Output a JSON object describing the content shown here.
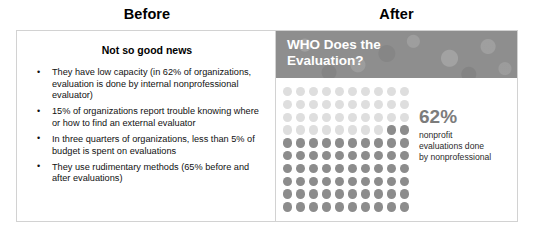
{
  "columns": {
    "before_title": "Before",
    "after_title": "After"
  },
  "before_panel": {
    "heading": "Not so good news",
    "bullets": [
      "They have low capacity (in 62% of organizations, evaluation is done by internal nonprofessional evaluator)",
      "15% of organizations report trouble knowing where or how to find an external evaluator",
      "In three quarters of organizations, less than 5% of budget is spent on evaluations",
      "They use rudimentary methods (65% before and after evaluations)"
    ]
  },
  "after_panel": {
    "banner_title": "WHO Does the\nEvaluation?",
    "callout_figure": "62%",
    "callout_caption": "nonprofit\nevaluations done\nby nonprofessional"
  },
  "colors": {
    "banner_background": "#8e8e8e",
    "banner_text": "#ffffff",
    "dot_filled": "#8c8c8c",
    "dot_empty": "#dedede",
    "callout_figure": "#7c7c7c",
    "panel_border": "#d2d2d2"
  },
  "chart_data": {
    "type": "waffle",
    "title": "WHO Does the Evaluation?",
    "rows": 10,
    "columns": 10,
    "total_cells": 100,
    "filled_cells": 62,
    "unit": "percent",
    "value": 62,
    "label": "nonprofit evaluations done by nonprofessional",
    "fill_order": "bottom-left-to-top-right",
    "series": [
      {
        "name": "nonprofessional evaluations",
        "value": 62,
        "color": "#8c8c8c"
      },
      {
        "name": "remainder",
        "value": 38,
        "color": "#dedede"
      }
    ]
  }
}
